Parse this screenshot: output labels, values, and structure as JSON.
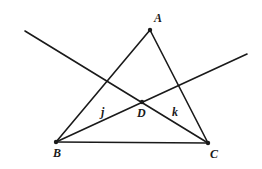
{
  "figure": {
    "points": [
      {
        "name": "A",
        "x": 150,
        "y": 30,
        "label_dx": 4,
        "label_dy": -8
      },
      {
        "name": "B",
        "x": 56,
        "y": 142,
        "label_dx": -3,
        "label_dy": 15
      },
      {
        "name": "C",
        "x": 208,
        "y": 143,
        "label_dx": 2,
        "label_dy": 15
      },
      {
        "name": "D",
        "x": 142,
        "y": 102,
        "label_dx": -5,
        "label_dy": 15
      }
    ],
    "segments": [
      {
        "name": "side-AB",
        "from": "A",
        "to": "B"
      },
      {
        "name": "side-AC",
        "from": "A",
        "to": "C"
      },
      {
        "name": "side-BC",
        "from": "B",
        "to": "C"
      }
    ],
    "lines": [
      {
        "name": "line-k",
        "label": "k",
        "x1": 25,
        "y1": 31,
        "x2": 208,
        "y2": 143,
        "label_x": 172,
        "label_y": 116
      },
      {
        "name": "line-j",
        "label": "j",
        "x1": 56,
        "y1": 142,
        "x2": 247,
        "y2": 54,
        "label_x": 101,
        "label_y": 116
      }
    ],
    "labels": {
      "A": "A",
      "B": "B",
      "C": "C",
      "D": "D",
      "j": "j",
      "k": "k"
    },
    "color": "#1a1a1a"
  }
}
